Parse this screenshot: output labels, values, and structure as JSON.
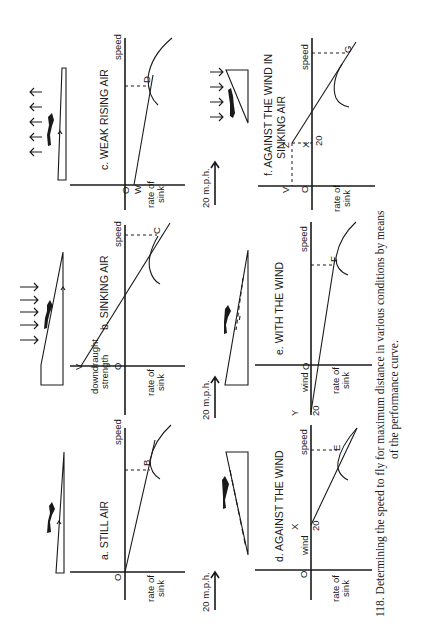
{
  "figure": {
    "caption_line1": "118. Determining the speed to fly for maximum distance in various conditions by means",
    "caption_line2": "of the performance curve.",
    "orientation": "rotated 90° counter-clockwise"
  },
  "panels": {
    "a": {
      "title": "a. STILL AIR",
      "origin": "O",
      "point": "B",
      "x_axis": "speed",
      "y_axis_1": "rate of",
      "y_axis_2": "sink"
    },
    "b": {
      "title": "b. SINKING AIR",
      "origin": "O",
      "point": "C",
      "start_point": "V",
      "x_axis": "speed",
      "y_axis_1": "rate of",
      "y_axis_2": "sink",
      "offset_1": "downdraught",
      "offset_2": "strength"
    },
    "c": {
      "title": "c. WEAK RISING AIR",
      "origin": "O",
      "point": "D",
      "start_point": "W",
      "x_axis": "speed",
      "y_axis_1": "rate of",
      "y_axis_2": "sink"
    },
    "d": {
      "title": "d. AGAINST THE WIND",
      "origin": "O",
      "point": "E",
      "start_point": "X",
      "tick": "20",
      "wind": "wind",
      "x_axis": "speed",
      "y_axis_1": "rate of",
      "y_axis_2": "sink"
    },
    "e": {
      "title": "e. WITH THE WIND",
      "origin": "O",
      "point": "F",
      "start_point": "Y",
      "tick": "20",
      "wind": "wind",
      "x_axis": "speed",
      "y_axis_1": "rate of",
      "y_axis_2": "sink"
    },
    "f": {
      "title_1": "f. AGAINST THE WIND IN",
      "title_2": "SINKING AIR",
      "origin": "O",
      "point": "G",
      "start_point": "X",
      "z_point": "Z",
      "v_point": "V",
      "tick": "20",
      "x_axis": "speed",
      "y_axis_1": "rate of",
      "y_axis_2": "sink"
    }
  },
  "wind_arrows": {
    "label_1": "20 m.p.h.",
    "label_2": "20 m.p.h.",
    "label_3": "20 m.p.h."
  },
  "colors": {
    "ink": "#1a1a1a",
    "paper": "#ffffff"
  }
}
